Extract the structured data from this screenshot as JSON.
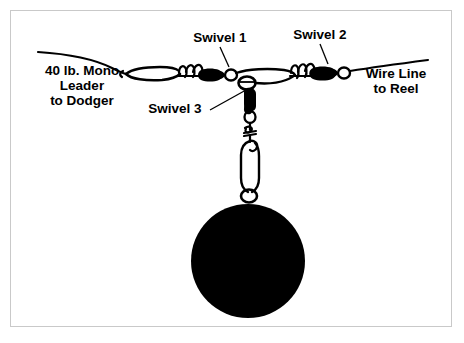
{
  "diagram": {
    "background_color": "#ffffff",
    "ink_color": "#000000",
    "frame_color": "#c9c9c9"
  },
  "labels": {
    "left_line": "40 lb. Mono\nLeader\nto Dodger",
    "right_line": "Wire Line\nto Reel",
    "swivel1": "Swivel 1",
    "swivel2": "Swivel 2",
    "swivel3": "Swivel 3"
  },
  "parts": {
    "mono_leader": "mono-leader-line",
    "mono_loop": "mono-loop",
    "swivel1_body": "swivel-1-barrel",
    "swivel2_body": "swivel-2-barrel",
    "swivel3_body": "swivel-3-barrel",
    "wire_line": "wire-line",
    "snap_clip": "snap-clip",
    "ball_weight": "cannonball-weight"
  }
}
